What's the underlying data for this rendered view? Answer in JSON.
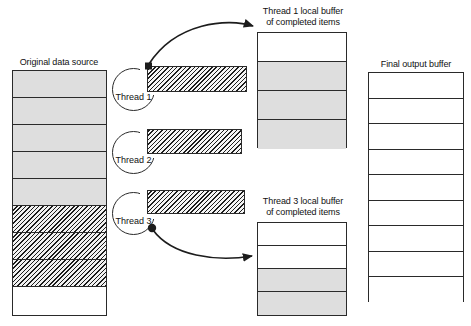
{
  "figure": {
    "type": "diagram"
  },
  "source_stack": {
    "caption": "Original data source",
    "cells": [
      {
        "state": "pending"
      },
      {
        "state": "pending"
      },
      {
        "state": "pending"
      },
      {
        "state": "pending"
      },
      {
        "state": "pending"
      },
      {
        "state": "in-progress"
      },
      {
        "state": "in-progress"
      },
      {
        "state": "in-progress"
      },
      {
        "state": "empty"
      }
    ]
  },
  "threads": [
    {
      "label": "Thread 1"
    },
    {
      "label": "Thread 2"
    },
    {
      "label": "Thread 3"
    }
  ],
  "work_bars": [
    {
      "owner": "Thread 1",
      "state": "in-progress"
    },
    {
      "owner": "Thread 2",
      "state": "in-progress"
    },
    {
      "owner": "Thread 3",
      "state": "in-progress"
    }
  ],
  "thread1_buffer": {
    "caption_line1": "Thread 1 local buffer",
    "caption_line2": "of completed items",
    "cells": [
      {
        "state": "empty"
      },
      {
        "state": "filled"
      },
      {
        "state": "filled"
      },
      {
        "state": "filled"
      }
    ]
  },
  "thread3_buffer": {
    "caption_line1": "Thread 3 local buffer",
    "caption_line2": "of completed items",
    "cells": [
      {
        "state": "empty"
      },
      {
        "state": "empty"
      },
      {
        "state": "filled"
      },
      {
        "state": "filled"
      }
    ]
  },
  "final_buffer": {
    "caption": "Final output buffer",
    "cells": [
      {
        "state": "empty"
      },
      {
        "state": "empty"
      },
      {
        "state": "empty"
      },
      {
        "state": "empty"
      },
      {
        "state": "empty"
      },
      {
        "state": "empty"
      },
      {
        "state": "empty"
      },
      {
        "state": "empty"
      },
      {
        "state": "empty"
      }
    ]
  },
  "arrows": [
    {
      "name": "thread1-to-buffer",
      "from": "Thread 1 work item",
      "to": "Thread 1 local buffer"
    },
    {
      "name": "thread3-to-buffer",
      "from": "Thread 3",
      "to": "Thread 3 local buffer"
    }
  ],
  "colors": {
    "stroke": "#2a2a2a",
    "filled_cell": "#dedede",
    "empty_cell": "#ffffff",
    "hatch": "#1c1c1c",
    "background": "#ffffff"
  }
}
